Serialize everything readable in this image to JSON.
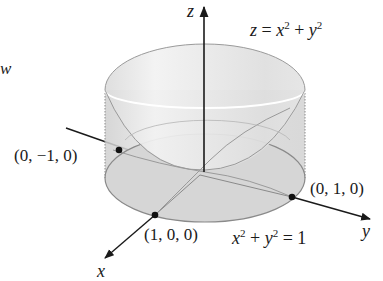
{
  "figure": {
    "cropped_left_text": "w",
    "surface_label": {
      "var_z": "z",
      "eq": "=",
      "var_x": "x",
      "exp_x": "2",
      "plus": "+",
      "var_y": "y",
      "exp_y": "2"
    },
    "cylinder_label": {
      "var_x": "x",
      "exp_x": "2",
      "plus": "+",
      "var_y": "y",
      "exp_y": "2",
      "eq": "=",
      "rhs": "1"
    },
    "axes": {
      "z": "z",
      "y": "y",
      "x": "x"
    },
    "points": [
      {
        "label": "(0, −1, 0)"
      },
      {
        "label": "(0, 1, 0)"
      },
      {
        "label": "(1, 0, 0)"
      }
    ],
    "colors": {
      "surface_fill": "#e6e6e6",
      "surface_stroke": "#8a8a8a",
      "cylinder_fill": "#d9d9d9",
      "axis": "#1a1a1a",
      "rim_highlight": "#f7f7f7"
    }
  }
}
